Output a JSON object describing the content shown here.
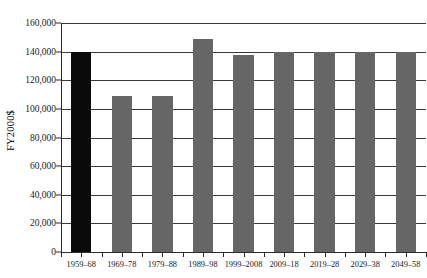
{
  "chart_data": {
    "type": "bar",
    "title": "",
    "xlabel": "",
    "ylabel": "FY2000$",
    "ylim": [
      0,
      160000
    ],
    "grid": true,
    "legend": "none",
    "ytick_labels": [
      "160,000",
      "140,000",
      "120,000",
      "100,000",
      "80,000",
      "60,000",
      "40,000",
      "20,000",
      "0"
    ],
    "ytick_values": [
      160000,
      140000,
      120000,
      100000,
      80000,
      60000,
      40000,
      20000,
      0
    ],
    "categories": [
      "1959–68",
      "1969–78",
      "1979–88",
      "1989–98",
      "1999–2008",
      "2009–18",
      "2019–28",
      "2029–38",
      "2049–58"
    ],
    "values": [
      140000,
      109000,
      109000,
      149000,
      138000,
      140000,
      140000,
      140000,
      140000
    ],
    "bar_colors": [
      "#0a0a0a",
      "#666666",
      "#666666",
      "#666666",
      "#666666",
      "#666666",
      "#666666",
      "#666666",
      "#666666"
    ]
  }
}
